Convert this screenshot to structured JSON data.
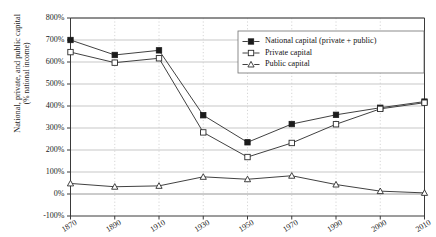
{
  "chart_data": {
    "type": "line",
    "title": "",
    "xlabel": "",
    "ylabel": "National, private, and public capital",
    "ylabel_line2": "(% national income)",
    "grid": true,
    "legend_position": "top-right",
    "categories": [
      "1870",
      "1890",
      "1910",
      "1930",
      "1950",
      "1970",
      "1990",
      "2000",
      "2010"
    ],
    "x": [
      1870,
      1890,
      1910,
      1930,
      1950,
      1970,
      1990,
      2000,
      2010
    ],
    "ylim": [
      -100,
      800
    ],
    "ytick_labels": [
      "800%",
      "700%",
      "600%",
      "500%",
      "400%",
      "300%",
      "200%",
      "100%",
      "0%",
      "-100%"
    ],
    "ytick_values": [
      800,
      700,
      600,
      500,
      400,
      300,
      200,
      100,
      0,
      -100
    ],
    "xtick_labels": [
      "1870",
      "1890",
      "1910",
      "1930",
      "1950",
      "1970",
      "1990",
      "2000",
      "2010"
    ],
    "series": [
      {
        "name": "National capital (private + public)",
        "marker": "filled-square",
        "values": [
          700,
          632,
          653,
          358,
          235,
          318,
          360,
          392,
          420
        ]
      },
      {
        "name": "Private capital",
        "marker": "open-square",
        "values": [
          645,
          597,
          617,
          280,
          168,
          232,
          317,
          387,
          415
        ]
      },
      {
        "name": "Public capital",
        "marker": "open-triangle",
        "values": [
          48,
          33,
          37,
          78,
          67,
          83,
          43,
          13,
          5
        ]
      }
    ],
    "colors": {
      "line": "#2b2b2b",
      "marker_fill": "#1b1b1b",
      "marker_open": "#ffffff",
      "grid": "#b9b9b9",
      "grid_vertical": "#cccccc",
      "axis": "#3a3a3a"
    }
  }
}
